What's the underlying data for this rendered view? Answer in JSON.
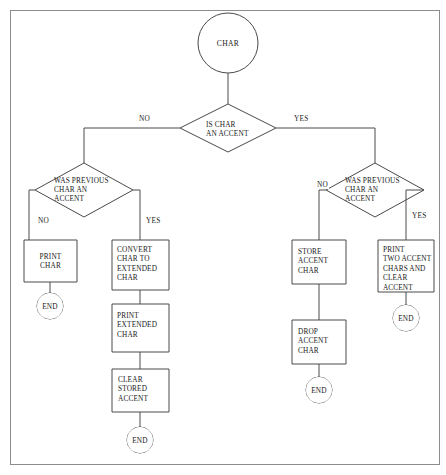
{
  "diagram": {
    "colors": {
      "stroke": "#4a4a4a",
      "frame": "#8c8c8c",
      "background": "#ffffff",
      "text": "#1a1a1a"
    },
    "start": {
      "label": "CHAR"
    },
    "decisions": {
      "is_accent": {
        "label": "IS CHAR\nAN ACCENT",
        "line1": "IS CHAR",
        "line2": "AN ACCENT"
      },
      "prev_accent_left": {
        "line1": "WAS PREVIOUS",
        "line2": "CHAR AN",
        "line3": "ACCENT"
      },
      "prev_accent_right": {
        "line1": "WAS PREVIOUS",
        "line2": "CHAR AN",
        "line3": "ACCENT"
      }
    },
    "edge_labels": {
      "root_no": "NO",
      "root_yes": "YES",
      "left_no": "NO",
      "left_yes": "YES",
      "right_no": "NO",
      "right_yes": "YES"
    },
    "processes": {
      "print_char": {
        "line1": "PRINT",
        "line2": "CHAR"
      },
      "convert_char": {
        "line1": "CONVERT",
        "line2": "CHAR TO",
        "line3": "EXTENDED",
        "line4": "CHAR"
      },
      "print_extended": {
        "line1": "PRINT",
        "line2": "EXTENDED",
        "line3": "CHAR"
      },
      "clear_stored_accent": {
        "line1": "CLEAR",
        "line2": "STORED",
        "line3": "ACCENT"
      },
      "store_accent": {
        "line1": "STORE",
        "line2": "ACCENT",
        "line3": "CHAR"
      },
      "drop_accent": {
        "line1": "DROP",
        "line2": "ACCENT",
        "line3": "CHAR"
      },
      "print_two_accent": {
        "line1": "PRINT",
        "line2": "TWO ACCENT",
        "line3": "CHARS AND",
        "line4": "CLEAR",
        "line5": "ACCENT"
      }
    },
    "terminators": {
      "end_print_char": "END",
      "end_clear_stored": "END",
      "end_drop_accent": "END",
      "end_print_two": "END"
    }
  }
}
